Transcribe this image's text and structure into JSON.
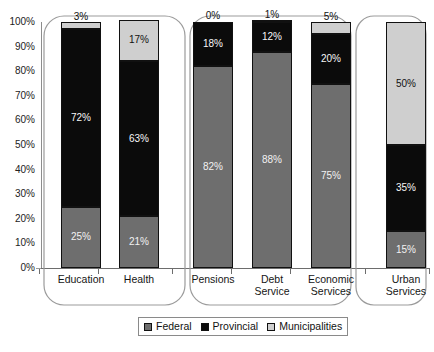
{
  "chart_data": {
    "type": "bar",
    "stacked": true,
    "stacked_normalized": true,
    "title": "",
    "subtitle": "",
    "xlabel": "",
    "ylabel": "",
    "ylim": [
      0,
      100
    ],
    "yticks": [
      "0%",
      "10%",
      "20%",
      "30%",
      "40%",
      "50%",
      "60%",
      "70%",
      "80%",
      "90%",
      "100%"
    ],
    "ytick_values": [
      0,
      10,
      20,
      30,
      40,
      50,
      60,
      70,
      80,
      90,
      100
    ],
    "grid": false,
    "legend_position": "bottom",
    "categories": [
      "Education",
      "Health",
      "Pensions",
      "Debt Service",
      "Economic Services",
      "Urban Services"
    ],
    "series": [
      {
        "name": "Federal",
        "color": "#6e6e6e",
        "values": [
          25,
          21,
          82,
          88,
          75,
          15
        ],
        "labels": [
          "25%",
          "21%",
          "82%",
          "88%",
          "75%",
          "15%"
        ]
      },
      {
        "name": "Provincial",
        "color": "#0b0b0b",
        "values": [
          72,
          63,
          18,
          12,
          20,
          35
        ],
        "labels": [
          "72%",
          "63%",
          "18%",
          "12%",
          "20%",
          "35%"
        ]
      },
      {
        "name": "Municipalities",
        "color": "#cfcfcf",
        "values": [
          3,
          17,
          0,
          1,
          5,
          50
        ],
        "labels": [
          "3%",
          "17%",
          "0%",
          "1%",
          "5%",
          "50%"
        ]
      }
    ],
    "groups": [
      {
        "label": "",
        "categories": [
          "Education",
          "Health"
        ]
      },
      {
        "label": "",
        "categories": [
          "Pensions",
          "Debt Service",
          "Economic Services"
        ]
      },
      {
        "label": "",
        "categories": [
          "Urban Services"
        ]
      }
    ]
  },
  "axis": {
    "y_ticks": [
      {
        "label": "100%",
        "value": 100
      },
      {
        "label": "90%",
        "value": 90
      },
      {
        "label": "80%",
        "value": 80
      },
      {
        "label": "70%",
        "value": 70
      },
      {
        "label": "60%",
        "value": 60
      },
      {
        "label": "50%",
        "value": 50
      },
      {
        "label": "40%",
        "value": 40
      },
      {
        "label": "30%",
        "value": 30
      },
      {
        "label": "20%",
        "value": 20
      },
      {
        "label": "10%",
        "value": 10
      },
      {
        "label": "0%",
        "value": 0
      }
    ]
  },
  "categories": [
    {
      "line1": "Education",
      "line2": ""
    },
    {
      "line1": "Health",
      "line2": ""
    },
    {
      "line1": "Pensions",
      "line2": ""
    },
    {
      "line1": "Debt",
      "line2": "Service"
    },
    {
      "line1": "Economic",
      "line2": "Services"
    },
    {
      "line1": "Urban",
      "line2": "Services"
    }
  ],
  "legend": {
    "items": [
      {
        "label": "Federal",
        "color": "#6e6e6e"
      },
      {
        "label": "Provincial",
        "color": "#0b0b0b"
      },
      {
        "label": "Municipalities",
        "color": "#cfcfcf"
      }
    ]
  }
}
